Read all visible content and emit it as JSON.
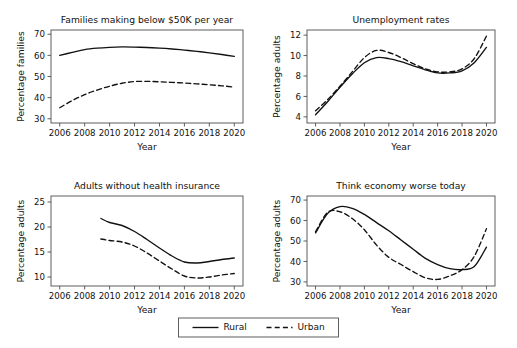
{
  "figure": {
    "background": "#ffffff",
    "ink_color": "#111111",
    "axis_color": "#4d4d4d"
  },
  "legend": {
    "position": "bottom-center",
    "entries": [
      {
        "label": "Rural",
        "style": "solid"
      },
      {
        "label": "Urban",
        "style": "dashed"
      }
    ]
  },
  "chart_data": [
    {
      "type": "line",
      "title": "Families making below $50K per year",
      "xlabel": "Year",
      "ylabel": "Percentage families",
      "xlim": [
        2005.3,
        2020.7
      ],
      "ylim": [
        28,
        72
      ],
      "xticks": [
        2006,
        2008,
        2010,
        2012,
        2014,
        2016,
        2018,
        2020
      ],
      "yticks": [
        30,
        40,
        50,
        60,
        70
      ],
      "grid": false,
      "x": [
        2006,
        2007,
        2008,
        2009,
        2010,
        2011,
        2012,
        2013,
        2014,
        2015,
        2016,
        2017,
        2018,
        2019,
        2020
      ],
      "series": [
        {
          "name": "Rural",
          "style": "solid",
          "values": [
            60.0,
            61.4,
            62.7,
            63.4,
            63.8,
            64.0,
            63.9,
            63.7,
            63.4,
            63.0,
            62.5,
            61.9,
            61.2,
            60.4,
            59.5
          ]
        },
        {
          "name": "Urban",
          "style": "dashed",
          "values": [
            35.2,
            38.6,
            41.4,
            43.6,
            45.4,
            46.8,
            47.6,
            47.7,
            47.5,
            47.2,
            46.9,
            46.5,
            46.1,
            45.6,
            45.0
          ]
        }
      ]
    },
    {
      "type": "line",
      "title": "Unemployment rates",
      "xlabel": "Year",
      "ylabel": "Percentage adults",
      "xlim": [
        2005.3,
        2020.7
      ],
      "ylim": [
        3.4,
        12.5
      ],
      "xticks": [
        2006,
        2008,
        2010,
        2012,
        2014,
        2016,
        2018,
        2020
      ],
      "yticks": [
        4,
        6,
        8,
        10,
        12
      ],
      "grid": false,
      "x": [
        2006,
        2007,
        2008,
        2009,
        2010,
        2011,
        2012,
        2013,
        2014,
        2015,
        2016,
        2017,
        2018,
        2019,
        2020
      ],
      "series": [
        {
          "name": "Rural",
          "style": "solid",
          "values": [
            4.2,
            5.5,
            6.9,
            8.2,
            9.3,
            9.8,
            9.7,
            9.4,
            9.0,
            8.6,
            8.3,
            8.3,
            8.5,
            9.3,
            10.8
          ]
        },
        {
          "name": "Urban",
          "style": "dashed",
          "values": [
            4.6,
            5.7,
            7.0,
            8.4,
            9.8,
            10.5,
            10.3,
            9.8,
            9.2,
            8.7,
            8.4,
            8.4,
            8.7,
            9.7,
            11.9
          ]
        }
      ]
    },
    {
      "type": "line",
      "title": "Adults without health insurance",
      "xlabel": "Year",
      "ylabel": "Percentage adults",
      "xlim": [
        2005.3,
        2020.7
      ],
      "ylim": [
        8.2,
        26.2
      ],
      "xticks": [
        2006,
        2008,
        2010,
        2012,
        2014,
        2016,
        2018,
        2020
      ],
      "yticks": [
        10,
        15,
        20,
        25
      ],
      "grid": false,
      "x": [
        2009.3,
        2010,
        2011,
        2012,
        2013,
        2014,
        2015,
        2016,
        2017,
        2018,
        2019,
        2020
      ],
      "series": [
        {
          "name": "Rural",
          "style": "solid",
          "values": [
            21.7,
            20.9,
            20.3,
            19.1,
            17.5,
            15.8,
            14.2,
            13.0,
            12.8,
            13.1,
            13.5,
            13.8
          ]
        },
        {
          "name": "Urban",
          "style": "dashed",
          "values": [
            17.6,
            17.3,
            17.0,
            16.2,
            14.8,
            13.2,
            11.6,
            10.2,
            9.8,
            10.0,
            10.4,
            10.7
          ]
        }
      ]
    },
    {
      "type": "line",
      "title": "Think economy worse today",
      "xlabel": "Year",
      "ylabel": "Percentage adults",
      "xlim": [
        2005.3,
        2020.7
      ],
      "ylim": [
        28,
        72
      ],
      "xticks": [
        2006,
        2008,
        2010,
        2012,
        2014,
        2016,
        2018,
        2020
      ],
      "yticks": [
        30,
        40,
        50,
        60,
        70
      ],
      "grid": false,
      "x": [
        2006,
        2007,
        2008,
        2009,
        2010,
        2011,
        2012,
        2013,
        2014,
        2015,
        2016,
        2017,
        2018,
        2019,
        2020
      ],
      "series": [
        {
          "name": "Rural",
          "style": "solid",
          "values": [
            54.0,
            63.5,
            66.8,
            66.0,
            63.0,
            59.0,
            55.0,
            50.5,
            46.0,
            41.5,
            38.5,
            36.5,
            36.0,
            37.5,
            47.0
          ]
        },
        {
          "name": "Urban",
          "style": "dashed",
          "values": [
            54.5,
            64.0,
            64.3,
            61.0,
            55.5,
            48.0,
            42.0,
            38.5,
            35.0,
            32.0,
            31.2,
            33.0,
            36.0,
            42.5,
            56.0
          ]
        }
      ]
    }
  ]
}
